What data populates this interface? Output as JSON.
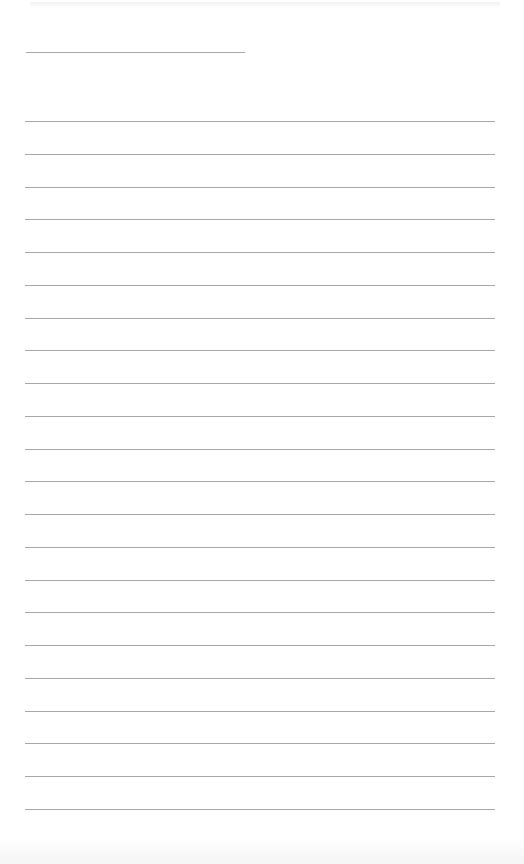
{
  "page": {
    "type": "lined-paper",
    "background_color": "#ffffff",
    "rule_color": "#8a8a8a",
    "header_rule": {
      "y": 52,
      "x_start": 26,
      "x_end": 245
    },
    "rules": {
      "x_start": 25,
      "x_end": 495,
      "y_positions": [
        121,
        154,
        187,
        219,
        252,
        285,
        318,
        350,
        383,
        416,
        449,
        481,
        514,
        547,
        580,
        612,
        645,
        678,
        711,
        743,
        776,
        809
      ]
    },
    "text_content": []
  }
}
